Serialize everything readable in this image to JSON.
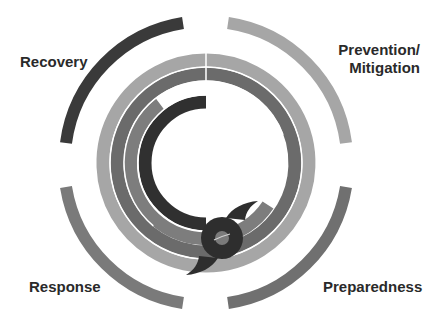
{
  "diagram": {
    "phases": [
      {
        "id": "recovery",
        "label": "Recovery",
        "color": "#3a3a3a"
      },
      {
        "id": "prevention",
        "label_line1": "Prevention/",
        "label_line2": "Mitigation",
        "color": "#a6a6a6"
      },
      {
        "id": "preparedness",
        "label": "Preparedness",
        "color": "#6f6f6f"
      },
      {
        "id": "response",
        "label": "Response",
        "color": "#7a7a7a"
      }
    ],
    "center_icon": "hurricane-icon",
    "colors": {
      "ring_light": "#a6a6a6",
      "ring_mid": "#6b6b6b",
      "ring_mid2": "#7d7d7d",
      "ring_dark": "#303030",
      "background": "#ffffff"
    }
  }
}
